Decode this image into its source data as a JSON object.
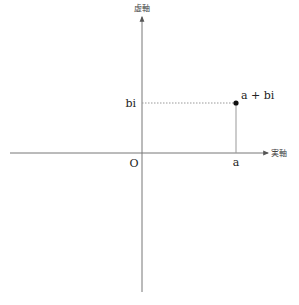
{
  "diagram": {
    "axes": {
      "real_axis_label": "実軸",
      "imaginary_axis_label": "虚軸",
      "origin_label": "O"
    },
    "point": {
      "label": "a + bi",
      "real_label": "a",
      "imag_label": "bi"
    },
    "colors": {
      "axis": "#777777",
      "guide": "#999999",
      "point": "#111111"
    }
  }
}
